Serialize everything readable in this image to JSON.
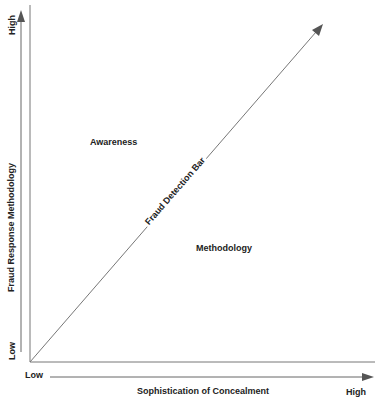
{
  "diagram": {
    "y_axis": {
      "title": "Fraud Response Methodology",
      "low_label": "Low",
      "high_label": "High"
    },
    "x_axis": {
      "title": "Sophistication of Concealment",
      "low_label": "Low",
      "high_label": "High"
    },
    "diagonal": {
      "label": "Fraud Detection Bar"
    },
    "regions": {
      "upper_left": "Awareness",
      "lower_right": "Methodology"
    },
    "colors": {
      "line": "#777777",
      "arrow": "#555555",
      "text": "#222222"
    }
  }
}
